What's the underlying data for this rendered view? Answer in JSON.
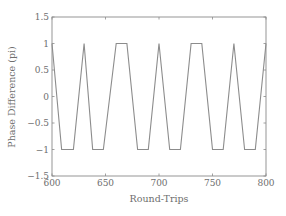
{
  "chart_data": {
    "type": "line",
    "title": "",
    "xlabel": "Round-Trips",
    "ylabel": "Phase Difference (pi)",
    "xlim": [
      600,
      800
    ],
    "ylim": [
      -1.5,
      1.5
    ],
    "xticks": [
      600,
      650,
      700,
      750,
      800
    ],
    "xtick_labels": [
      "600",
      "650",
      "700",
      "750",
      "800"
    ],
    "yticks": [
      -1.5,
      -1,
      -0.5,
      0,
      0.5,
      1,
      1.5
    ],
    "ytick_labels": [
      "−1.5",
      "−1",
      "−0.5",
      "0",
      "0.5",
      "1",
      "1.5"
    ],
    "grid": false,
    "legend": null,
    "series": [
      {
        "name": "phase difference",
        "color": "#8c8c8c",
        "x": [
          600,
          609,
          620,
          630,
          638,
          648,
          660,
          670,
          680,
          690,
          700,
          710,
          720,
          730,
          740,
          750,
          760,
          770,
          780,
          790,
          800
        ],
        "y": [
          1,
          -1,
          -1,
          1,
          -1,
          -1,
          1,
          1,
          -1,
          -1,
          1,
          -1,
          -1,
          1,
          1,
          -1,
          -1,
          1,
          -1,
          -1,
          1
        ]
      }
    ]
  }
}
